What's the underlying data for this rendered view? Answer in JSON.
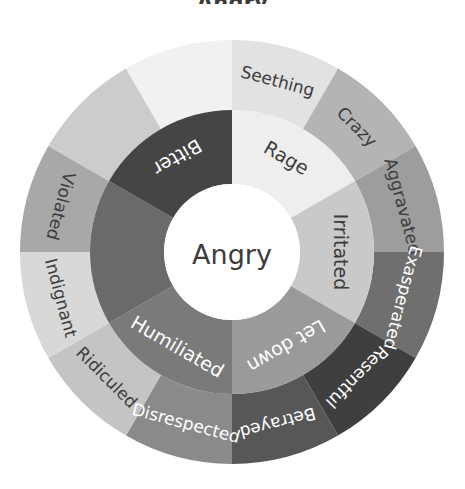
{
  "diagram": {
    "kind": "emotion-wheel",
    "title_partial": "Angry",
    "center": {
      "label": "Angry",
      "fill": "#ffffff",
      "text_color": "#3c3c3c"
    },
    "geometry": {
      "cx": 232,
      "cy": 252,
      "r_center": 68,
      "r_inner_outer": 142,
      "r_outer_outer": 212,
      "inner_segment_count": 6,
      "outer_segment_count": 12,
      "inner_segment_degrees": 60,
      "outer_segment_degrees": 30
    },
    "inner_ring": [
      {
        "label": "Rage",
        "start": 0,
        "end": 60,
        "fill": "#eeeeee",
        "text_color": "#3c3c3c"
      },
      {
        "label": "Irritated",
        "start": 60,
        "end": 120,
        "fill": "#c9c9c9",
        "text_color": "#3c3c3c"
      },
      {
        "label": "Let down",
        "start": 120,
        "end": 180,
        "fill": "#9a9a9a",
        "text_color": "#ffffff"
      },
      {
        "label": "Humiliated",
        "start": 180,
        "end": 240,
        "fill": "#7a7a7a",
        "text_color": "#ffffff"
      },
      {
        "label": "",
        "start": 240,
        "end": 300,
        "fill": "#6a6a6a",
        "text_color": "#ffffff"
      },
      {
        "label": "Bitter",
        "start": 300,
        "end": 360,
        "fill": "#454545",
        "text_color": "#ffffff"
      }
    ],
    "outer_ring": [
      {
        "label": "Seething",
        "start": 0,
        "end": 30,
        "fill": "#e2e2e2",
        "text_color": "#3c3c3c"
      },
      {
        "label": "Crazy",
        "start": 30,
        "end": 60,
        "fill": "#b4b4b4",
        "text_color": "#3c3c3c"
      },
      {
        "label": "Aggravated",
        "start": 60,
        "end": 90,
        "fill": "#9d9d9d",
        "text_color": "#3c3c3c"
      },
      {
        "label": "Exasperated",
        "start": 90,
        "end": 120,
        "fill": "#6f6f6f",
        "text_color": "#ffffff"
      },
      {
        "label": "Resentful",
        "start": 120,
        "end": 150,
        "fill": "#3f3f3f",
        "text_color": "#ffffff"
      },
      {
        "label": "Betrayed",
        "start": 150,
        "end": 180,
        "fill": "#575757",
        "text_color": "#ffffff"
      },
      {
        "label": "Disrespected",
        "start": 180,
        "end": 210,
        "fill": "#8a8a8a",
        "text_color": "#ffffff"
      },
      {
        "label": "Ridiculed",
        "start": 210,
        "end": 240,
        "fill": "#c4c4c4",
        "text_color": "#3c3c3c"
      },
      {
        "label": "Indignant",
        "start": 240,
        "end": 270,
        "fill": "#d8d8d8",
        "text_color": "#3c3c3c"
      },
      {
        "label": "Violated",
        "start": 270,
        "end": 300,
        "fill": "#a8a8a8",
        "text_color": "#3c3c3c"
      },
      {
        "label": "",
        "start": 300,
        "end": 330,
        "fill": "#cccccc",
        "text_color": "#3c3c3c"
      },
      {
        "label": "",
        "start": 330,
        "end": 360,
        "fill": "#f1f1f1",
        "text_color": "#3c3c3c"
      }
    ],
    "background": "#ffffff"
  },
  "chart_data": {
    "type": "pie",
    "title": "Angry",
    "rings": [
      {
        "name": "core-emotion",
        "categories": [
          "Angry"
        ],
        "values": [
          360
        ]
      },
      {
        "name": "inner-ring",
        "categories": [
          "Rage",
          "Irritated",
          "Let down",
          "Humiliated",
          "",
          "Bitter"
        ],
        "values": [
          60,
          60,
          60,
          60,
          60,
          60
        ]
      },
      {
        "name": "outer-ring",
        "categories": [
          "Seething",
          "Crazy",
          "Aggravated",
          "Exasperated",
          "Resentful",
          "Betrayed",
          "Disrespected",
          "Ridiculed",
          "Indignant",
          "Violated",
          "",
          ""
        ],
        "values": [
          30,
          30,
          30,
          30,
          30,
          30,
          30,
          30,
          30,
          30,
          30,
          30
        ]
      }
    ],
    "legend": "none",
    "grid": false
  }
}
